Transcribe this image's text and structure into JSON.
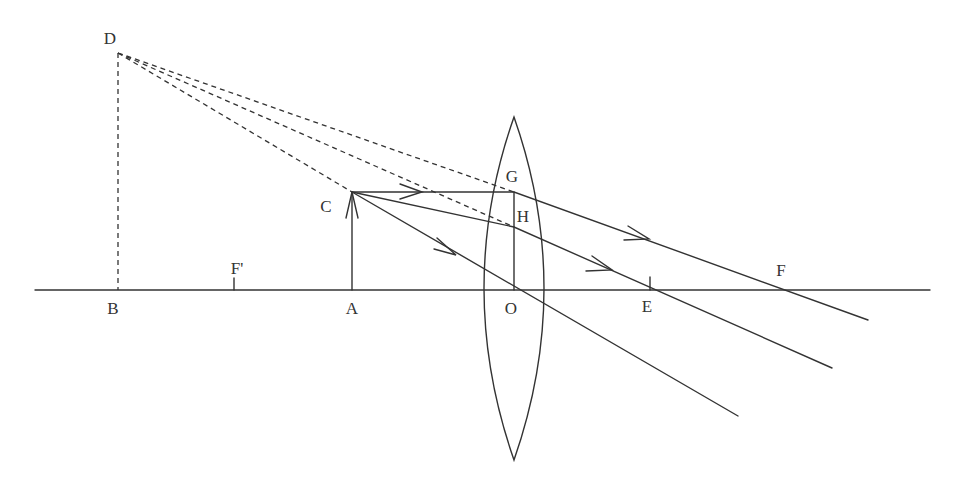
{
  "colors": {
    "stroke": "#333333",
    "background": "#ffffff"
  },
  "labels": {
    "D": "D",
    "B": "B",
    "F_prime": "F'",
    "A": "A",
    "C": "C",
    "G": "G",
    "H": "H",
    "O": "O",
    "E": "E",
    "F": "F"
  },
  "geometry": {
    "principal_axis": {
      "x1": 35,
      "y": 290,
      "x2": 930
    },
    "points": {
      "D": [
        118,
        53
      ],
      "B": [
        118,
        290
      ],
      "F_prime": [
        234,
        290
      ],
      "A": [
        352,
        290
      ],
      "C": [
        352,
        192
      ],
      "G": [
        514,
        192
      ],
      "H": [
        514,
        227
      ],
      "O": [
        514,
        290
      ],
      "E": [
        650,
        290
      ],
      "F": [
        777,
        290
      ]
    },
    "lens": {
      "center_x": 514,
      "top_y": 117,
      "bottom_y": 460,
      "half_width": 30
    },
    "rays_solid": [
      {
        "name": "parallel-ray",
        "path": [
          [
            352,
            192
          ],
          [
            514,
            192
          ],
          [
            868,
            320
          ]
        ]
      },
      {
        "name": "ray-through-H",
        "path": [
          [
            352,
            192
          ],
          [
            514,
            227
          ],
          [
            832,
            368
          ]
        ]
      },
      {
        "name": "central-ray",
        "path": [
          [
            352,
            192
          ],
          [
            738,
            416
          ]
        ]
      }
    ],
    "rays_dashed": [
      {
        "name": "virtual-ray-D-G",
        "path": [
          [
            118,
            53
          ],
          [
            514,
            192
          ]
        ]
      },
      {
        "name": "virtual-ray-D-H",
        "path": [
          [
            118,
            53
          ],
          [
            514,
            227
          ]
        ]
      },
      {
        "name": "virtual-ray-D-C",
        "path": [
          [
            118,
            53
          ],
          [
            352,
            192
          ]
        ]
      },
      {
        "name": "virtual-image-D-B",
        "path": [
          [
            118,
            53
          ],
          [
            118,
            290
          ]
        ]
      }
    ]
  }
}
